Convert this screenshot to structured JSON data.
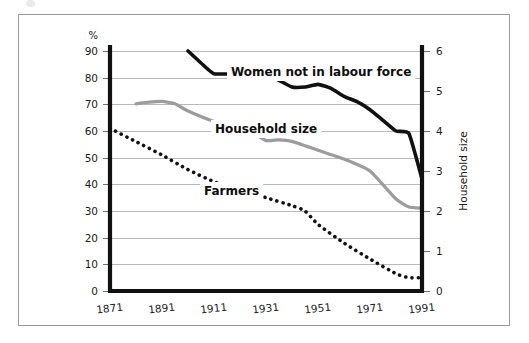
{
  "figure": {
    "frame_border_color": "#9a9a9a",
    "background": "#ffffff"
  },
  "axes": {
    "left": {
      "unit_label": "%",
      "ticks": [
        "90",
        "80",
        "70",
        "60",
        "50",
        "40",
        "30",
        "20",
        "10",
        "0"
      ],
      "min": 0,
      "max": 90
    },
    "right": {
      "title": "Household size",
      "ticks": [
        "6",
        "5",
        "4",
        "3",
        "2",
        "1",
        "0"
      ],
      "min": 0,
      "max": 6
    },
    "bottom": {
      "ticks": [
        "1871",
        "1891",
        "1911",
        "1931",
        "1951",
        "1971",
        "1991"
      ],
      "min": 1871,
      "max": 1991
    }
  },
  "series_labels": {
    "women": "Women not in labour force",
    "household": "Household size",
    "farmers": "Farmers"
  },
  "colors": {
    "women": "#111111",
    "household": "#9c9c9c",
    "farmers": "#111111",
    "gridline": "#b9b9b9",
    "axis": "#111111"
  },
  "chart_data": {
    "type": "line",
    "title": "",
    "subtitle": "",
    "xlabel": "",
    "ylabel": "%",
    "y2label": "Household size",
    "xlim": [
      1871,
      1991
    ],
    "ylim": [
      0,
      90
    ],
    "y2lim": [
      0,
      6
    ],
    "grid": true,
    "legend_position": "inline-labels",
    "x_ticks": [
      1871,
      1891,
      1911,
      1931,
      1951,
      1971,
      1991
    ],
    "y_ticks": [
      0,
      10,
      20,
      30,
      40,
      50,
      60,
      70,
      80,
      90
    ],
    "y2_ticks": [
      0,
      1,
      2,
      3,
      4,
      5,
      6
    ],
    "series": [
      {
        "name": "Women not in labour force",
        "axis": "left",
        "unit": "%",
        "style": "solid",
        "color": "#111111",
        "x": [
          1901,
          1906,
          1911,
          1921,
          1926,
          1931,
          1936,
          1941,
          1946,
          1951,
          1956,
          1961,
          1966,
          1971,
          1976,
          1981,
          1986,
          1991
        ],
        "values": [
          90,
          85.5,
          81.5,
          81.5,
          82,
          81.5,
          79,
          76.5,
          76.5,
          77.5,
          76,
          73,
          71,
          68,
          64,
          60,
          59,
          42
        ]
      },
      {
        "name": "Household size",
        "axis": "right",
        "unit": "persons",
        "style": "solid",
        "color": "#9c9c9c",
        "x": [
          1881,
          1886,
          1891,
          1896,
          1901,
          1911,
          1921,
          1926,
          1931,
          1936,
          1941,
          1951,
          1961,
          1971,
          1981,
          1986,
          1991
        ],
        "values": [
          4.68,
          4.72,
          4.74,
          4.68,
          4.5,
          4.24,
          4.08,
          3.96,
          3.76,
          3.78,
          3.74,
          3.52,
          3.3,
          3.0,
          2.3,
          2.1,
          2.07
        ],
        "values_in_percent_scale": [
          70.2,
          70.8,
          71.1,
          70.2,
          67.5,
          63.6,
          61.2,
          59.4,
          56.4,
          56.7,
          56.1,
          52.8,
          49.5,
          45,
          34.5,
          31.5,
          31
        ]
      },
      {
        "name": "Farmers",
        "axis": "left",
        "unit": "%",
        "style": "dotted",
        "color": "#111111",
        "x": [
          1871,
          1881,
          1891,
          1901,
          1911,
          1921,
          1931,
          1941,
          1946,
          1951,
          1961,
          1971,
          1981,
          1986,
          1991
        ],
        "values": [
          61,
          56,
          51,
          45.5,
          41,
          38,
          35,
          32,
          30,
          25,
          18,
          12,
          6.5,
          5,
          5
        ]
      }
    ]
  }
}
